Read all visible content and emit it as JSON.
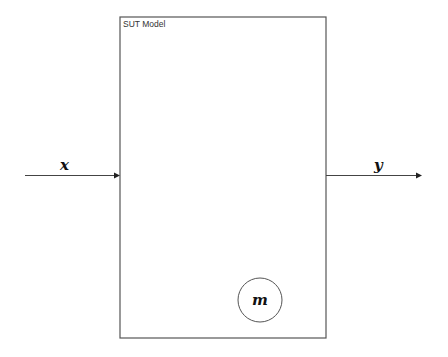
{
  "diagram": {
    "block": {
      "title": "SUT Model",
      "x": 120,
      "y": 17,
      "width": 206,
      "height": 321
    },
    "input": {
      "label": "x",
      "x1": 25,
      "x2": 120,
      "y": 175
    },
    "output": {
      "label": "y",
      "x1": 326,
      "x2": 422,
      "y": 175
    },
    "parameter_node": {
      "label": "m",
      "cx": 260,
      "cy": 300,
      "r": 22
    },
    "colors": {
      "stroke": "#555555",
      "text": "#111111",
      "background": "#ffffff"
    }
  }
}
